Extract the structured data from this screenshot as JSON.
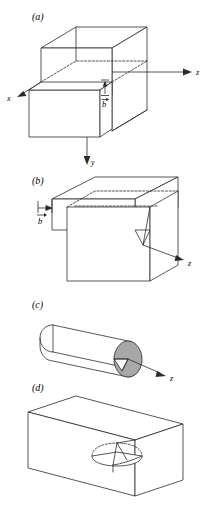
{
  "figure": {
    "background_color": "#ffffff",
    "line_color": "#2b2b2b",
    "shade_color": "#a8a8a8",
    "panels": [
      {
        "id": "a",
        "label": "(a)",
        "description": "Rectangular block cut and displaced by Burgers vector b, producing an edge dislocation",
        "axes": [
          {
            "name": "x",
            "label": "x",
            "direction": "down-left"
          },
          {
            "name": "y",
            "label": "y",
            "direction": "down"
          },
          {
            "name": "z",
            "label": "z",
            "direction": "right"
          }
        ],
        "vectors": [
          {
            "name": "burgers-vector",
            "label": "b",
            "overline": true
          }
        ]
      },
      {
        "id": "b",
        "label": "(b)",
        "description": "Block with slip step offset by Burgers vector b along the cut plane",
        "axes": [
          {
            "name": "z",
            "label": "z",
            "direction": "right"
          }
        ],
        "vectors": [
          {
            "name": "burgers-vector",
            "label": "b",
            "overline": true
          }
        ]
      },
      {
        "id": "c",
        "label": "(c)",
        "description": "Cylinder with shaded elliptical end face cut radially, screw dislocation along axis",
        "axes": [
          {
            "name": "z",
            "label": "z",
            "direction": "right"
          }
        ],
        "vectors": []
      },
      {
        "id": "d",
        "label": "(d)",
        "description": "Rectangular block with dashed circular dislocation loop and folded surface on top face",
        "axes": [],
        "vectors": []
      }
    ]
  }
}
